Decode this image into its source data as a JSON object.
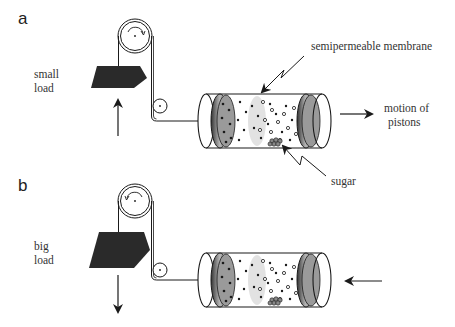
{
  "panels": [
    {
      "id": "a",
      "label": "a",
      "load_label_line1": "small",
      "load_label_line2": "load",
      "load_direction": "up",
      "piston_motion": "right",
      "rotation": "clockwise"
    },
    {
      "id": "b",
      "label": "b",
      "load_label_line1": "big",
      "load_label_line2": "load",
      "load_direction": "down",
      "piston_motion": "left",
      "rotation": "counterclockwise"
    }
  ],
  "annotations": {
    "membrane": "semipermeable membrane",
    "motion_line1": "motion of",
    "motion_line2": "pistons",
    "sugar": "sugar"
  },
  "colors": {
    "ink": "#1a1a1a",
    "load": "#2a2a2a",
    "piston_face": "#9a9a9a",
    "membrane": "#e2e2e2"
  }
}
